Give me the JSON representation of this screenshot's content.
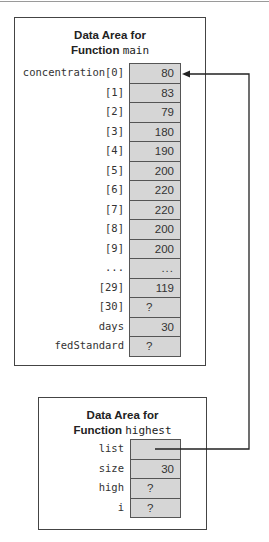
{
  "diagram": {
    "main_area": {
      "title_line1": "Data Area for",
      "title_function_word": "Function",
      "function_name": "main",
      "rows": [
        {
          "label": "concentration[0]",
          "value": "80",
          "kind": "num"
        },
        {
          "label": "[1]",
          "value": "83",
          "kind": "num"
        },
        {
          "label": "[2]",
          "value": "79",
          "kind": "num"
        },
        {
          "label": "[3]",
          "value": "180",
          "kind": "num"
        },
        {
          "label": "[4]",
          "value": "190",
          "kind": "num"
        },
        {
          "label": "[5]",
          "value": "200",
          "kind": "num"
        },
        {
          "label": "[6]",
          "value": "220",
          "kind": "num"
        },
        {
          "label": "[7]",
          "value": "220",
          "kind": "num"
        },
        {
          "label": "[8]",
          "value": "200",
          "kind": "num"
        },
        {
          "label": "[9]",
          "value": "200",
          "kind": "num"
        },
        {
          "label": "...",
          "value": "...",
          "kind": "dots"
        },
        {
          "label": "[29]",
          "value": "119",
          "kind": "num"
        },
        {
          "label": "[30]",
          "value": "?",
          "kind": "q"
        },
        {
          "label": "days",
          "value": "30",
          "kind": "num"
        },
        {
          "label": "fedStandard",
          "value": "?",
          "kind": "q"
        }
      ]
    },
    "highest_area": {
      "title_line1": "Data Area for",
      "title_function_word": "Function",
      "function_name": "highest",
      "rows": [
        {
          "label": "list",
          "value": "",
          "kind": "ptr"
        },
        {
          "label": "size",
          "value": "30",
          "kind": "num"
        },
        {
          "label": "high",
          "value": "?",
          "kind": "q"
        },
        {
          "label": "i",
          "value": "?",
          "kind": "q"
        }
      ]
    },
    "pointer_arrow": {
      "from": "highest.list",
      "to": "main.concentration[0]",
      "color": "#222222"
    },
    "colors": {
      "cell_fill": "#d6d6d6",
      "border": "#444444"
    }
  }
}
